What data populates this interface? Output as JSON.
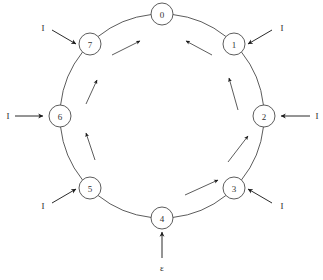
{
  "diagram": {
    "type": "ring-state-diagram",
    "title": "",
    "geometry": {
      "center_x": 162,
      "center_y": 116,
      "ring_radius": 102,
      "node_radius": 11
    },
    "colors": {
      "stroke": "#4a4a4a",
      "arrow": "#1a1a1a",
      "node_fill": "#ffffff",
      "background": "#ffffff",
      "text": "#333333"
    },
    "nodes": [
      {
        "id": "node-0",
        "label": "0",
        "angle_deg": -90,
        "cx": 162,
        "cy": 14
      },
      {
        "id": "node-1",
        "label": "1",
        "angle_deg": -45,
        "cx": 234,
        "cy": 44
      },
      {
        "id": "node-2",
        "label": "2",
        "angle_deg": 0,
        "cx": 264,
        "cy": 116
      },
      {
        "id": "node-3",
        "label": "3",
        "angle_deg": 45,
        "cx": 234,
        "cy": 188
      },
      {
        "id": "node-4",
        "label": "4",
        "angle_deg": 90,
        "cx": 162,
        "cy": 218
      },
      {
        "id": "node-5",
        "label": "5",
        "angle_deg": 135,
        "cx": 90,
        "cy": 188
      },
      {
        "id": "node-6",
        "label": "6",
        "angle_deg": 180,
        "cx": 60,
        "cy": 116
      },
      {
        "id": "node-7",
        "label": "7",
        "angle_deg": 225,
        "cx": 90,
        "cy": 44
      }
    ],
    "ring_edges": [
      {
        "from": "7",
        "to": "0"
      },
      {
        "from": "0",
        "to": "1"
      },
      {
        "from": "1",
        "to": "2"
      },
      {
        "from": "2",
        "to": "3"
      },
      {
        "from": "3",
        "to": "4"
      },
      {
        "from": "4",
        "to": "5"
      },
      {
        "from": "5",
        "to": "6"
      },
      {
        "from": "6",
        "to": "7"
      }
    ],
    "flow_arrows": [
      {
        "id": "flow-7-0",
        "segment": "7->0",
        "x1": 112,
        "y1": 55,
        "x2": 140,
        "y2": 41
      },
      {
        "id": "flow-1-0",
        "segment": "1->0",
        "x1": 212,
        "y1": 55,
        "x2": 186,
        "y2": 41
      },
      {
        "id": "flow-2-1",
        "segment": "2->1",
        "x1": 238,
        "y1": 110,
        "x2": 229,
        "y2": 78
      },
      {
        "id": "flow-3-2",
        "segment": "3->2",
        "x1": 228,
        "y1": 162,
        "x2": 248,
        "y2": 136
      },
      {
        "id": "flow-4-3",
        "segment": "4->3",
        "x1": 185,
        "y1": 195,
        "x2": 218,
        "y2": 180
      },
      {
        "id": "flow-5-6",
        "segment": "5->6",
        "x1": 95,
        "y1": 160,
        "x2": 86,
        "y2": 133
      },
      {
        "id": "flow-6-7",
        "segment": "6->7",
        "x1": 86,
        "y1": 104,
        "x2": 97,
        "y2": 80
      }
    ],
    "input_arrows": [
      {
        "id": "input-1",
        "target": "1",
        "label": "I",
        "x1": 272,
        "y1": 30,
        "x2": 248,
        "y2": 44,
        "lx": 282,
        "ly": 28
      },
      {
        "id": "input-2",
        "target": "2",
        "label": "I",
        "x1": 310,
        "y1": 116,
        "x2": 281,
        "y2": 116,
        "lx": 317,
        "ly": 116
      },
      {
        "id": "input-3",
        "target": "3",
        "label": "I",
        "x1": 272,
        "y1": 203,
        "x2": 248,
        "y2": 189,
        "lx": 282,
        "ly": 206
      },
      {
        "id": "input-4",
        "target": "4",
        "label": "ε",
        "x1": 162,
        "y1": 258,
        "x2": 162,
        "y2": 232,
        "lx": 162,
        "ly": 268
      },
      {
        "id": "input-5",
        "target": "5",
        "label": "I",
        "x1": 52,
        "y1": 203,
        "x2": 76,
        "y2": 189,
        "lx": 43,
        "ly": 206
      },
      {
        "id": "input-6",
        "target": "6",
        "label": "I",
        "x1": 15,
        "y1": 116,
        "x2": 43,
        "y2": 116,
        "lx": 8,
        "ly": 116
      },
      {
        "id": "input-7",
        "target": "7",
        "label": "I",
        "x1": 52,
        "y1": 30,
        "x2": 76,
        "y2": 44,
        "lx": 43,
        "ly": 28
      }
    ]
  }
}
